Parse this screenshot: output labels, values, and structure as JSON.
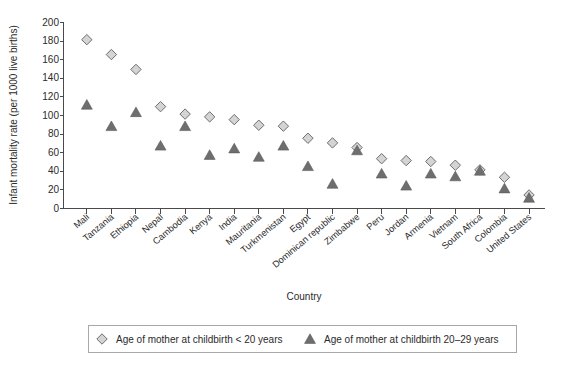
{
  "chart_data": {
    "type": "scatter",
    "title": "",
    "xlabel": "Country",
    "ylabel": "Infant mortality rate (per 1000 live births)",
    "ylim": [
      0,
      200
    ],
    "ytick_step": 20,
    "yticks": [
      0,
      20,
      40,
      60,
      80,
      100,
      120,
      140,
      160,
      180,
      200
    ],
    "grid": false,
    "legend_position": "bottom",
    "categories": [
      "Mali",
      "Tanzania",
      "Ethiopia",
      "Nepal",
      "Cambodia",
      "Kenya",
      "India",
      "Mauritania",
      "Turkmenistan",
      "Egypt",
      "Dominican republic",
      "Zimbabwe",
      "Peru",
      "Jordan",
      "Armenia",
      "Vietnam",
      "South Africa",
      "Colombia",
      "United States"
    ],
    "series": [
      {
        "name": "Age of mother at childbirth < 20 years",
        "marker": "diamond",
        "color": "#d4d4d4",
        "edge_color": "#6d6d6d",
        "values": [
          181,
          165,
          149,
          109,
          101,
          98,
          95,
          89,
          88,
          75,
          70,
          65,
          53,
          51,
          50,
          46,
          41,
          33,
          14
        ]
      },
      {
        "name": "Age of mother at childbirth 20–29 years",
        "marker": "triangle",
        "color": "#6e6e6e",
        "edge_color": "#5a5a5a",
        "values": [
          111,
          88,
          103,
          67,
          88,
          57,
          64,
          55,
          67,
          45,
          26,
          62,
          37,
          24,
          37,
          34,
          40,
          21,
          11
        ]
      }
    ]
  },
  "axis": {
    "y_title": "Infant mortality rate (per 1000 live births)",
    "x_title": "Country"
  },
  "legend": {
    "items": [
      {
        "marker": "diamond-marker",
        "label": "Age of mother at childbirth < 20 years"
      },
      {
        "marker": "triangle-marker",
        "label": "Age of mother at childbirth 20–29 years"
      }
    ]
  }
}
